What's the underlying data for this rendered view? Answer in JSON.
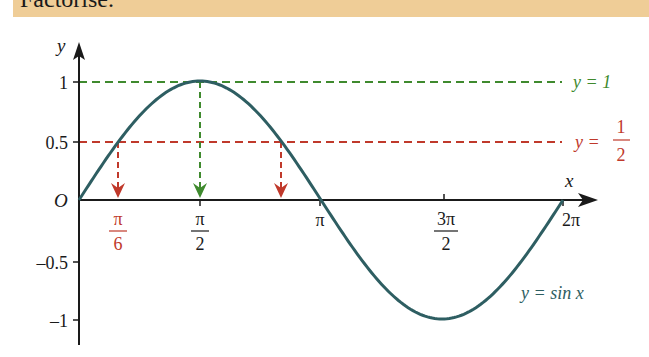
{
  "banner": {
    "text": "Factorise."
  },
  "colors": {
    "curve": "#2e5e62",
    "axis": "#1a1a1a",
    "green": "#3f8a2e",
    "red": "#c0392b",
    "banner": "#efcd97"
  },
  "axes": {
    "x_label": "x",
    "y_label": "y",
    "origin_label": "O",
    "y_ticks": [
      "1",
      "0.5",
      "–0.5",
      "–1"
    ],
    "x_ticks": [
      {
        "num": "π",
        "den": "6",
        "color": "red"
      },
      {
        "num": "π",
        "den": "2",
        "color": "black"
      },
      {
        "plain": "π"
      },
      {
        "num": "3π",
        "den": "2",
        "color": "black"
      },
      {
        "plain": "2π"
      }
    ]
  },
  "annotations": {
    "line_y1": "y = 1",
    "line_yhalf_prefix": "y =",
    "line_yhalf_num": "1",
    "line_yhalf_den": "2",
    "curve_label": "y = sin x"
  },
  "chart_data": {
    "type": "line",
    "title": "",
    "xlabel": "x",
    "ylabel": "y",
    "series": [
      {
        "name": "y = sin x",
        "x": [
          0,
          0.5236,
          1.0472,
          1.5708,
          2.0944,
          2.618,
          3.1416,
          3.6652,
          4.1888,
          4.7124,
          5.236,
          5.7596,
          6.2832
        ],
        "values": [
          0,
          0.5,
          0.866,
          1,
          0.866,
          0.5,
          0,
          -0.5,
          -0.866,
          -1,
          -0.866,
          -0.5,
          0
        ]
      }
    ],
    "reference_lines": [
      {
        "name": "y = 1",
        "y": 1,
        "style": "dashed",
        "color": "green"
      },
      {
        "name": "y = 1/2",
        "y": 0.5,
        "style": "dashed",
        "color": "red"
      }
    ],
    "drop_arrows": [
      {
        "x": "π/6",
        "from_y": 0.5,
        "color": "red"
      },
      {
        "x": "π/2",
        "from_y": 1,
        "color": "green"
      },
      {
        "x": "5π/6",
        "from_y": 0.5,
        "color": "red"
      }
    ],
    "x_ticks": [
      "π/6",
      "π/2",
      "π",
      "3π/2",
      "2π"
    ],
    "y_ticks": [
      1,
      0.5,
      -0.5,
      -1
    ],
    "xlim": [
      0,
      6.2832
    ],
    "ylim": [
      -1,
      1
    ],
    "grid": false,
    "legend": "none"
  }
}
